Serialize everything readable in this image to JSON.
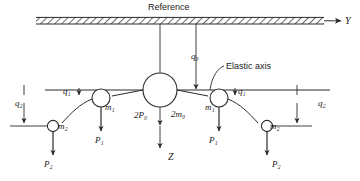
{
  "figure": {
    "title_label": "Reference",
    "elastic_axis_label": "Elastic axis",
    "axes": {
      "horizontal_axis_label": "Y",
      "vertical_axis_label": "Z"
    },
    "coordinates": {
      "q0": "q₀",
      "q1_left": "q₁",
      "q1_right": "q₁",
      "q2_left": "q₂",
      "q2_right": "q₂"
    },
    "masses": {
      "center": "2m₀",
      "m1_left": "m₁",
      "m1_right": "m₁",
      "m2_left": "m₂",
      "m2_right": "m₂"
    },
    "forces": {
      "center": "2P₀",
      "p1_left": "P₁",
      "p1_right": "P₁",
      "p2_left": "P₂",
      "p2_right": "P₂"
    },
    "colors": {
      "line": "#2b2b2b",
      "hatch": "#808080",
      "text": "#1a1a1a",
      "background": "#ffffff"
    }
  }
}
